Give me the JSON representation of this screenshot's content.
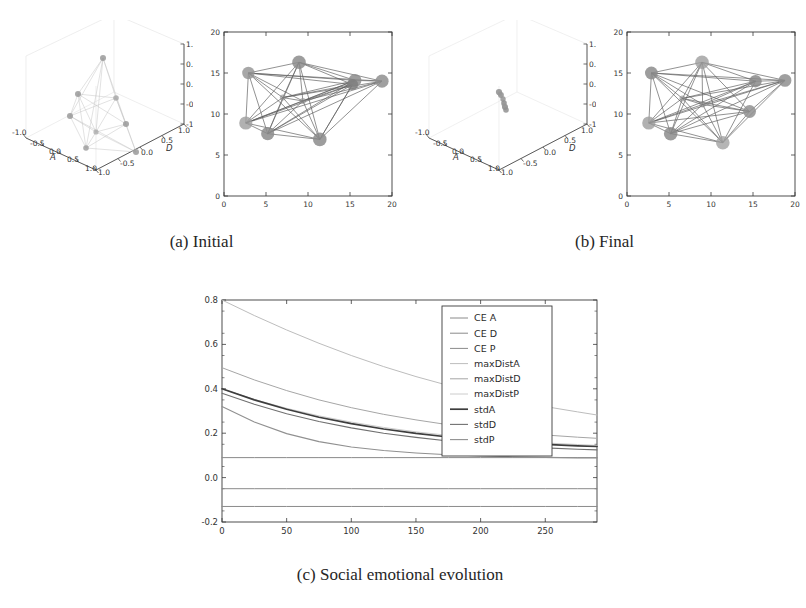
{
  "figure": {
    "subfigures": [
      {
        "id": "a",
        "caption": "(a) Initial"
      },
      {
        "id": "b",
        "caption": "(b) Final"
      },
      {
        "id": "c",
        "caption": "(c) Social emotional evolution"
      }
    ]
  },
  "panel_a": {
    "caption": "(a) Initial",
    "scatter3d": {
      "axis_labels": {
        "x": "A",
        "y": "D",
        "z": "P"
      },
      "x_ticks": [
        "-1.0",
        "-0.5",
        "0.0",
        "0.5",
        "1.0"
      ],
      "y_ticks": [
        "-1.0",
        "-0.5",
        "0.0",
        "0.5",
        "1.0"
      ],
      "z_ticks": [
        "-1.0",
        "-0.5",
        "0.0",
        "0.5",
        "1.0"
      ],
      "state": "dispersed",
      "points": [
        [
          0.05,
          0.62,
          0.78
        ],
        [
          -0.48,
          0.1,
          0.05
        ],
        [
          -0.3,
          -0.35,
          -0.3
        ],
        [
          0.12,
          0.05,
          -0.05
        ],
        [
          0.46,
          -0.1,
          -0.18
        ],
        [
          0.3,
          -0.42,
          -0.55
        ],
        [
          0.05,
          -0.6,
          -0.72
        ],
        [
          -0.1,
          0.3,
          0.25
        ],
        [
          0.35,
          0.25,
          0.1
        ],
        [
          -0.2,
          -0.1,
          -0.45
        ]
      ]
    },
    "network": {
      "xlim": [
        0,
        20
      ],
      "ylim": [
        0,
        20
      ],
      "x_ticks": [
        0,
        5,
        10,
        15,
        20
      ],
      "y_ticks": [
        0,
        5,
        10,
        15,
        20
      ],
      "nodes": [
        {
          "x": 2.9,
          "y": 15.0
        },
        {
          "x": 8.9,
          "y": 16.3
        },
        {
          "x": 15.6,
          "y": 14.2
        },
        {
          "x": 18.8,
          "y": 14.1
        },
        {
          "x": 2.6,
          "y": 8.9
        },
        {
          "x": 5.2,
          "y": 7.6
        },
        {
          "x": 11.4,
          "y": 6.9
        },
        {
          "x": 15.3,
          "y": 13.7
        },
        {
          "x": 7.0,
          "y": 12.0
        },
        {
          "x": 9.4,
          "y": 11.6
        }
      ]
    }
  },
  "panel_b": {
    "caption": "(b) Final",
    "scatter3d": {
      "axis_labels": {
        "x": "A",
        "y": "D",
        "z": "P"
      },
      "x_ticks": [
        "-1.0",
        "-0.5",
        "0.0",
        "0.5",
        "1.0"
      ],
      "y_ticks": [
        "-1.0",
        "-0.5",
        "0.0",
        "0.5",
        "1.0"
      ],
      "z_ticks": [
        "-1.0",
        "-0.5",
        "0.0",
        "0.5",
        "1.0"
      ],
      "state": "converged",
      "points": [
        [
          -0.04,
          0.02,
          0.06
        ],
        [
          -0.02,
          0.0,
          0.03
        ],
        [
          0.0,
          -0.02,
          0.0
        ],
        [
          0.02,
          -0.03,
          -0.03
        ],
        [
          0.03,
          -0.05,
          -0.06
        ],
        [
          0.05,
          -0.06,
          -0.09
        ],
        [
          -0.01,
          0.01,
          0.01
        ],
        [
          0.01,
          -0.01,
          -0.01
        ],
        [
          0.04,
          -0.04,
          -0.05
        ],
        [
          0.02,
          0.0,
          -0.02
        ]
      ]
    },
    "network": {
      "xlim": [
        0,
        20
      ],
      "ylim": [
        0,
        20
      ],
      "x_ticks": [
        0,
        5,
        10,
        15,
        20
      ],
      "y_ticks": [
        0,
        5,
        10,
        15,
        20
      ],
      "nodes": [
        {
          "x": 2.9,
          "y": 15.0
        },
        {
          "x": 8.9,
          "y": 16.3
        },
        {
          "x": 15.3,
          "y": 14.1
        },
        {
          "x": 18.8,
          "y": 14.2
        },
        {
          "x": 2.6,
          "y": 8.9
        },
        {
          "x": 5.2,
          "y": 7.6
        },
        {
          "x": 11.4,
          "y": 6.5
        },
        {
          "x": 14.6,
          "y": 10.3
        },
        {
          "x": 6.6,
          "y": 11.9
        },
        {
          "x": 9.0,
          "y": 11.4
        }
      ]
    }
  },
  "chart_data": {
    "type": "line",
    "title": "",
    "caption": "(c) Social emotional evolution",
    "xlabel": "",
    "ylabel": "",
    "xlim": [
      0,
      290
    ],
    "ylim": [
      -0.2,
      0.8
    ],
    "x_ticks": [
      0,
      50,
      100,
      150,
      200,
      250
    ],
    "y_ticks": [
      -0.2,
      0.0,
      0.2,
      0.4,
      0.6,
      0.8
    ],
    "x_tick_labels": [
      "0",
      "50",
      "100",
      "150",
      "200",
      "250"
    ],
    "y_tick_labels": [
      "-0.2",
      "0.0",
      "0.2",
      "0.4",
      "0.6",
      "0.8"
    ],
    "grid": false,
    "legend_position": "upper right",
    "x": [
      0,
      25,
      50,
      75,
      100,
      125,
      150,
      175,
      200,
      225,
      250,
      275,
      290
    ],
    "series": [
      {
        "name": "CE A",
        "color": "#8a8a8a",
        "width": 1.0,
        "values": [
          0.09,
          0.09,
          0.09,
          0.09,
          0.09,
          0.09,
          0.09,
          0.09,
          0.09,
          0.09,
          0.09,
          0.09,
          0.09
        ]
      },
      {
        "name": "CE D",
        "color": "#8a8a8a",
        "width": 1.0,
        "values": [
          -0.05,
          -0.05,
          -0.05,
          -0.05,
          -0.05,
          -0.05,
          -0.05,
          -0.05,
          -0.05,
          -0.05,
          -0.05,
          -0.05,
          -0.05
        ]
      },
      {
        "name": "CE P",
        "color": "#8a8a8a",
        "width": 1.0,
        "values": [
          -0.13,
          -0.13,
          -0.13,
          -0.13,
          -0.13,
          -0.13,
          -0.13,
          -0.13,
          -0.13,
          -0.13,
          -0.13,
          -0.13,
          -0.13
        ]
      },
      {
        "name": "maxDistA",
        "color": "#bdbdbd",
        "width": 1.0,
        "values": [
          0.8,
          0.73,
          0.665,
          0.605,
          0.55,
          0.5,
          0.455,
          0.415,
          0.38,
          0.348,
          0.32,
          0.296,
          0.282
        ]
      },
      {
        "name": "maxDistD",
        "color": "#a6a6a6",
        "width": 1.0,
        "values": [
          0.495,
          0.44,
          0.392,
          0.35,
          0.315,
          0.285,
          0.26,
          0.238,
          0.22,
          0.205,
          0.192,
          0.182,
          0.177
        ]
      },
      {
        "name": "maxDistP",
        "color": "#cccccc",
        "width": 1.0,
        "values": [
          0.4,
          0.352,
          0.312,
          0.278,
          0.25,
          0.226,
          0.206,
          0.19,
          0.176,
          0.165,
          0.156,
          0.149,
          0.145
        ]
      },
      {
        "name": "stdA",
        "color": "#3d3d3d",
        "width": 1.7,
        "values": [
          0.4,
          0.35,
          0.308,
          0.272,
          0.243,
          0.219,
          0.199,
          0.183,
          0.17,
          0.159,
          0.15,
          0.143,
          0.14
        ]
      },
      {
        "name": "stdD",
        "color": "#707070",
        "width": 1.1,
        "values": [
          0.38,
          0.33,
          0.288,
          0.253,
          0.224,
          0.2,
          0.181,
          0.165,
          0.152,
          0.142,
          0.134,
          0.128,
          0.125
        ]
      },
      {
        "name": "stdP",
        "color": "#909090",
        "width": 1.1,
        "values": [
          0.32,
          0.25,
          0.198,
          0.162,
          0.138,
          0.122,
          0.111,
          0.103,
          0.098,
          0.094,
          0.091,
          0.089,
          0.088
        ]
      }
    ]
  },
  "style": {
    "node_fill": "#8f8f8f",
    "node_stroke": "#6e6e6e",
    "edge_color": "#5a5a5a",
    "axis_color": "#3a3a3a",
    "text_color": "#333333",
    "faint_color": "#c9c9c9"
  }
}
